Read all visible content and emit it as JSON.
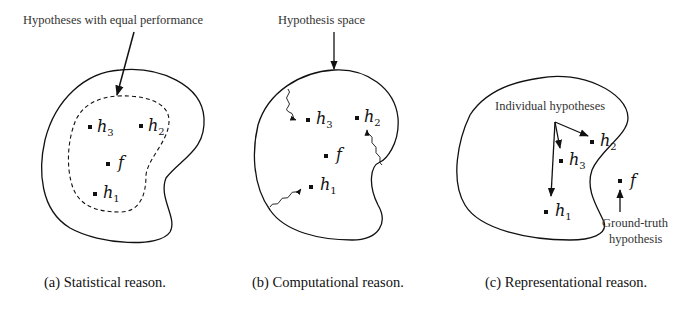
{
  "figure": {
    "panels": [
      {
        "id": "a",
        "caption": "(a) Statistical reason.",
        "annotation": "Hypotheses with equal performance",
        "points": [
          {
            "name": "h",
            "sub": "3"
          },
          {
            "name": "h",
            "sub": "2"
          },
          {
            "name": "f",
            "sub": ""
          },
          {
            "name": "h",
            "sub": "1"
          }
        ]
      },
      {
        "id": "b",
        "caption": "(b) Computational reason.",
        "annotation": "Hypothesis space",
        "points": [
          {
            "name": "h",
            "sub": "3"
          },
          {
            "name": "h",
            "sub": "2"
          },
          {
            "name": "f",
            "sub": ""
          },
          {
            "name": "h",
            "sub": "1"
          }
        ]
      },
      {
        "id": "c",
        "caption": "(c) Representational reason.",
        "annotation": "Individual hypotheses",
        "annotation2_line1": "Ground-truth",
        "annotation2_line2": "hypothesis",
        "points": [
          {
            "name": "h",
            "sub": "2"
          },
          {
            "name": "h",
            "sub": "3"
          },
          {
            "name": "h",
            "sub": "1"
          },
          {
            "name": "f",
            "sub": ""
          }
        ]
      }
    ],
    "colors": {
      "stroke": "#111111",
      "text": "#222222",
      "background": "#ffffff"
    }
  }
}
